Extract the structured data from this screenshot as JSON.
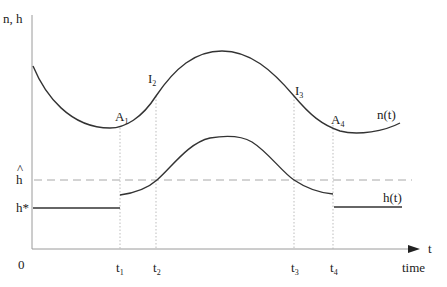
{
  "axes": {
    "y_label": "n, h",
    "x_label": "t",
    "x_caption": "time",
    "origin_label": "0"
  },
  "levels": {
    "h_hat_label": "h",
    "h_hat_accent": "^",
    "h_star_label": "h*"
  },
  "time_marks": [
    {
      "base": "t",
      "sub": "1"
    },
    {
      "base": "t",
      "sub": "2"
    },
    {
      "base": "t",
      "sub": "3"
    },
    {
      "base": "t",
      "sub": "4"
    }
  ],
  "points": [
    {
      "base": "A",
      "sub": "1"
    },
    {
      "base": "I",
      "sub": "2"
    },
    {
      "base": "I",
      "sub": "3"
    },
    {
      "base": "A",
      "sub": "4"
    }
  ],
  "curves": {
    "n_label": "n(t)",
    "h_label": "h(t)"
  },
  "colors": {
    "curve": "#333333",
    "axis": "#9a9a9a",
    "guide": "#b5b5b5"
  }
}
